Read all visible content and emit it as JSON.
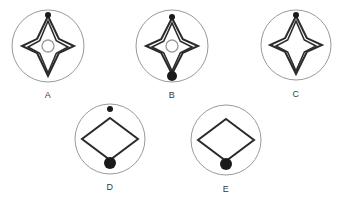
{
  "page": {
    "background_color": "#ffffff",
    "width": 341,
    "height": 197
  },
  "style": {
    "circle_stroke": "#9a9a9a",
    "diamond_stroke": "#2b2b2b",
    "center_ring_stroke": "#9e9e9e",
    "dot_fill": "#1a1a1a",
    "label_color": "#3a3a3a"
  },
  "figures": [
    {
      "id": "A",
      "label": "A",
      "circle": {
        "cx": 48,
        "cy": 46,
        "r": 36
      },
      "label_pos": {
        "x": 48,
        "y": 90
      },
      "diamond_layers": 2,
      "diamond_style": "concave-star",
      "diamond_rx": 26,
      "diamond_ry": 30,
      "center_ring": true,
      "center_ring_r": 6,
      "top_dot": true,
      "top_dot_r": 3,
      "top_dot_attached": true,
      "bottom_dot": false,
      "bottom_dot_r": 0
    },
    {
      "id": "B",
      "label": "B",
      "circle": {
        "cx": 172,
        "cy": 46,
        "r": 36
      },
      "label_pos": {
        "x": 172,
        "y": 90
      },
      "diamond_layers": 2,
      "diamond_style": "concave-star",
      "diamond_rx": 26,
      "diamond_ry": 28,
      "center_ring": true,
      "center_ring_r": 6,
      "top_dot": true,
      "top_dot_r": 3,
      "top_dot_attached": true,
      "bottom_dot": true,
      "bottom_dot_r": 5
    },
    {
      "id": "C",
      "label": "C",
      "circle": {
        "cx": 296,
        "cy": 45,
        "r": 35
      },
      "label_pos": {
        "x": 296,
        "y": 89
      },
      "diamond_layers": 2,
      "diamond_style": "concave-star",
      "diamond_rx": 26,
      "diamond_ry": 29,
      "center_ring": false,
      "center_ring_r": 0,
      "top_dot": true,
      "top_dot_r": 3,
      "top_dot_attached": true,
      "bottom_dot": false,
      "bottom_dot_r": 0
    },
    {
      "id": "D",
      "label": "D",
      "circle": {
        "cx": 110,
        "cy": 139,
        "r": 35
      },
      "label_pos": {
        "x": 110,
        "y": 182
      },
      "diamond_layers": 1,
      "diamond_style": "plain",
      "diamond_rx": 28,
      "diamond_ry": 21,
      "center_ring": false,
      "center_ring_r": 0,
      "top_dot": true,
      "top_dot_r": 3,
      "top_dot_attached": false,
      "bottom_dot": true,
      "bottom_dot_r": 6
    },
    {
      "id": "E",
      "label": "E",
      "circle": {
        "cx": 226,
        "cy": 140,
        "r": 35
      },
      "label_pos": {
        "x": 226,
        "y": 184
      },
      "diamond_layers": 1,
      "diamond_style": "plain",
      "diamond_rx": 28,
      "diamond_ry": 21,
      "center_ring": false,
      "center_ring_r": 0,
      "top_dot": false,
      "top_dot_r": 0,
      "bottom_dot": true,
      "bottom_dot_r": 6
    }
  ]
}
